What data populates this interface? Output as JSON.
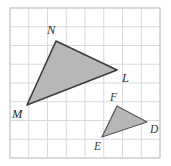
{
  "figure": {
    "background_color": "#ffffff",
    "grid": {
      "line_color": "#d7d9dd",
      "border_color": "#c3c6ca",
      "columns": 8,
      "rows": 8,
      "cell_size_px": 18.75,
      "origin_x_px": 10,
      "origin_y_px": 8,
      "width_px": 150,
      "height_px": 150
    },
    "shapes": [
      {
        "name": "triangle-MNL",
        "fill_color": "#b7b7b7",
        "stroke_color": "#3c3c3c",
        "stroke_width": 1.6,
        "points": "56,41 117,70 27,105",
        "vertices": [
          {
            "label": "N",
            "x": 56,
            "y": 41,
            "label_x": 47,
            "label_y": 34
          },
          {
            "label": "L",
            "x": 117,
            "y": 70,
            "label_x": 122,
            "label_y": 82
          },
          {
            "label": "M",
            "x": 27,
            "y": 105,
            "label_x": 12,
            "label_y": 118
          }
        ]
      },
      {
        "name": "triangle-DEF",
        "fill_color": "#b7b7b7",
        "stroke_color": "#5a5a5a",
        "stroke_width": 1.3,
        "points": "117,106 147,122 102,137",
        "vertices": [
          {
            "label": "F",
            "x": 117,
            "y": 106,
            "label_x": 110,
            "label_y": 101
          },
          {
            "label": "D",
            "x": 147,
            "y": 122,
            "label_x": 150,
            "label_y": 133
          },
          {
            "label": "E",
            "x": 102,
            "y": 137,
            "label_x": 94,
            "label_y": 150
          }
        ]
      }
    ]
  }
}
